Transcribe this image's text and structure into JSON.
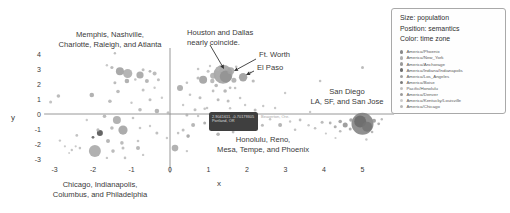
{
  "figure": {
    "background": "#ffffff"
  },
  "axes": {
    "x_label": "x",
    "y_label": "y",
    "x_ticks": [
      -3,
      -2,
      -1,
      0,
      1,
      2,
      3,
      4,
      5
    ],
    "y_ticks": [
      4,
      3,
      2,
      1,
      0,
      -1,
      -2,
      -3
    ],
    "axis_color": "#8c8c8c",
    "tick_color": "#3a3a3a"
  },
  "annotations": [
    {
      "name": "memphis-group",
      "lines": [
        "Memphis, Nashville,",
        "Charlotte, Raleigh, and Atlanta"
      ],
      "x": 110,
      "y": 30,
      "align": "center"
    },
    {
      "name": "houston-dallas",
      "lines": [
        "Houston and Dallas",
        "nearly coincide."
      ],
      "x": 187,
      "y": 28,
      "align": "left"
    },
    {
      "name": "ft-worth",
      "lines": [
        "Ft. Worth"
      ],
      "x": 259,
      "y": 50,
      "align": "left"
    },
    {
      "name": "el-paso",
      "lines": [
        "El Paso"
      ],
      "x": 257,
      "y": 63,
      "align": "left"
    },
    {
      "name": "san-diego-group",
      "lines": [
        "San Diego",
        "LA, SF, and San Jose"
      ],
      "x": 347,
      "y": 87,
      "align": "center"
    },
    {
      "name": "honolulu-group",
      "lines": [
        "Honolulu, Reno,",
        "Mesa, Tempe, and Phoenix"
      ],
      "x": 263,
      "y": 135,
      "align": "center"
    },
    {
      "name": "chicago-group",
      "lines": [
        "Chicago, Indianapolis,",
        "Columbus, and Philadelphia"
      ],
      "x": 100,
      "y": 180,
      "align": "center"
    }
  ],
  "arrows": [
    {
      "x1": 210,
      "y1": 45,
      "x2": 224,
      "y2": 69
    },
    {
      "x1": 256,
      "y1": 59,
      "x2": 234,
      "y2": 71
    },
    {
      "x1": 254,
      "y1": 71,
      "x2": 246,
      "y2": 75
    }
  ],
  "tooltip": {
    "line1": "2.9041611, -0.70179305",
    "line2": "Portland, OR",
    "side_text": "Beaverton, Ore.",
    "bg": "#3f3f3f"
  },
  "legend": {
    "title_lines": [
      "Size: population",
      "Position: semantics",
      "Color: time zone"
    ],
    "items": [
      {
        "label": "America/Phoenix",
        "color": "#8a8a8a"
      },
      {
        "label": "America/New_York",
        "color": "#b0b0b0"
      },
      {
        "label": "America/Anchorage",
        "color": "#9a9a9a"
      },
      {
        "label": "America/Indiana/Indianapolis",
        "color": "#6f6f6f"
      },
      {
        "label": "America/Los_Angeles",
        "color": "#a0a0a0"
      },
      {
        "label": "America/Boise",
        "color": "#7a7a7a"
      },
      {
        "label": "Pacific/Honolulu",
        "color": "#c0c0c0"
      },
      {
        "label": "America/Denver",
        "color": "#9a9a9a"
      },
      {
        "label": "America/Kentucky/Louisville",
        "color": "#cccccc"
      },
      {
        "label": "America/Chicago",
        "color": "#b8b8b8"
      }
    ]
  },
  "chart_data": {
    "type": "scatter",
    "title": "",
    "encoding": {
      "size": "population",
      "position": "semantics",
      "color": "time zone"
    },
    "xlabel": "x",
    "ylabel": "y",
    "xlim": [
      -3.5,
      5.9
    ],
    "ylim": [
      -3.9,
      4.4
    ],
    "grid": false,
    "legend_position": "top-right",
    "points_xyrc": [
      [
        -1.43,
        4.05,
        1.2,
        "#b5b5b5"
      ],
      [
        -1.51,
        3.1,
        1.6,
        "#b0b0b0"
      ],
      [
        -1.64,
        3.25,
        1.2,
        "#c0c0c0"
      ],
      [
        -1.3,
        2.85,
        4,
        "#9a9a9a"
      ],
      [
        -1.1,
        2.7,
        4.6,
        "#a8a8a8"
      ],
      [
        -0.78,
        2.6,
        3.6,
        "#a0a0a0"
      ],
      [
        -0.7,
        2.95,
        1.5,
        "#b5b5b5"
      ],
      [
        -0.52,
        2.85,
        1.4,
        "#ababab"
      ],
      [
        -0.4,
        2.7,
        2,
        "#b0b0b0"
      ],
      [
        -1.12,
        2.2,
        2.3,
        "#a5a5a5"
      ],
      [
        -0.9,
        2.3,
        1.3,
        "#bbbbbb"
      ],
      [
        -1.43,
        2.08,
        1.5,
        "#b0b0b0"
      ],
      [
        -0.6,
        2.2,
        2,
        "#aaaaaa"
      ],
      [
        -0.3,
        2.28,
        1.5,
        "#b5b5b5"
      ],
      [
        -1.35,
        1.5,
        1.8,
        "#b0b0b0"
      ],
      [
        -0.7,
        1.6,
        1.5,
        "#b8b8b8"
      ],
      [
        -0.4,
        1.75,
        1.2,
        "#c0c0c0"
      ],
      [
        -2.03,
        1.27,
        2.3,
        "#a5a5a5"
      ],
      [
        -1.56,
        0.85,
        1.8,
        "#b0b0b0"
      ],
      [
        -1.0,
        0.75,
        1.2,
        "#bdbdbd"
      ],
      [
        -0.52,
        0.95,
        1.5,
        "#b5b5b5"
      ],
      [
        -0.21,
        1.08,
        1.2,
        "#c2c2c2"
      ],
      [
        -3.1,
        0.8,
        1.5,
        "#b8b8b8"
      ],
      [
        -2.9,
        1.2,
        1.8,
        "#b0b0b0"
      ],
      [
        -0.78,
        0.28,
        1.8,
        "#b0b0b0"
      ],
      [
        -0.34,
        0.2,
        2.3,
        "#a8a8a8"
      ],
      [
        -0.05,
        0.08,
        1.5,
        "#b5b5b5"
      ],
      [
        -1.7,
        -0.15,
        1.8,
        "#b0b0b0"
      ],
      [
        -1.38,
        -0.4,
        4,
        "#a5a5a5"
      ],
      [
        -2.16,
        -0.4,
        1.2,
        "#c0c0c0"
      ],
      [
        -0.96,
        -0.27,
        1.3,
        "#bbbbbb"
      ],
      [
        -1.82,
        -1.27,
        3,
        "#4a4a4a"
      ],
      [
        -2.0,
        -1.55,
        1.4,
        "#5a5a5a"
      ],
      [
        -1.22,
        -1.07,
        4.6,
        "#9e9e9e"
      ],
      [
        -1.51,
        -0.93,
        1.8,
        "#b0b0b0"
      ],
      [
        -0.78,
        -0.93,
        1.3,
        "#bdbdbd"
      ],
      [
        -0.52,
        -0.8,
        1.2,
        "#c0c0c0"
      ],
      [
        -1.61,
        -1.8,
        2,
        "#aaaaaa"
      ],
      [
        -1.25,
        -1.93,
        1.8,
        "#b0b0b0"
      ],
      [
        -0.83,
        -1.8,
        1.3,
        "#bbbbbb"
      ],
      [
        -1.95,
        -2.47,
        6,
        "#a3a3a3"
      ],
      [
        -1.48,
        -2.47,
        1.8,
        "#b0b0b0"
      ],
      [
        -1.22,
        -2.27,
        1.5,
        "#b5b5b5"
      ],
      [
        -0.83,
        -2.27,
        2,
        "#ababab"
      ],
      [
        -0.7,
        -2.73,
        1.2,
        "#c0c0c0"
      ],
      [
        -2.34,
        -2.27,
        1.3,
        "#b8b8b8"
      ],
      [
        -2.45,
        -2.15,
        1.1,
        "#c0c0c0"
      ],
      [
        -2.55,
        -2.4,
        1.2,
        "#bbbbbb"
      ],
      [
        -2.73,
        -2.15,
        1.1,
        "#c2c2c2"
      ],
      [
        -2.62,
        -2.6,
        1.0,
        "#c5c5c5"
      ],
      [
        -1.64,
        -2.93,
        1.2,
        "#bdbdbd"
      ],
      [
        -1.17,
        -2.93,
        1.3,
        "#b8b8b8"
      ],
      [
        -2.86,
        -1.77,
        1.2,
        "#bdbdbd"
      ],
      [
        -2.42,
        -1.43,
        1.4,
        "#b8b8b8"
      ],
      [
        -1.87,
        -1.06,
        1.6,
        "#b0b0b0"
      ],
      [
        -0.34,
        -1.27,
        1.5,
        "#b5b5b5"
      ],
      [
        -0.08,
        -1.6,
        1.2,
        "#c0c0c0"
      ],
      [
        0.13,
        -2.27,
        3.3,
        "#a5a5a5"
      ],
      [
        0.44,
        -2.47,
        1.2,
        "#bdbdbd"
      ],
      [
        0.47,
        -1.47,
        1.8,
        "#9e9e9e"
      ],
      [
        0.21,
        -1.27,
        1.3,
        "#b8b8b8"
      ],
      [
        0.26,
        1.73,
        3,
        "#a3a3a3"
      ],
      [
        0.44,
        2.08,
        1.3,
        "#b8b8b8"
      ],
      [
        0.73,
        2.4,
        1.6,
        "#b0b0b0"
      ],
      [
        0.86,
        2.28,
        4,
        "#9a9a9a"
      ],
      [
        0.52,
        1.28,
        1.3,
        "#bbbbbb"
      ],
      [
        0.78,
        1.08,
        1.5,
        "#b3b3b3"
      ],
      [
        1.12,
        1.53,
        1.4,
        "#b5b5b5"
      ],
      [
        1.25,
        0.95,
        1.5,
        "#b0b0b0"
      ],
      [
        0.34,
        0.6,
        1.2,
        "#c0c0c0"
      ],
      [
        0.65,
        0.28,
        1.5,
        "#b5b5b5"
      ],
      [
        0.96,
        0.4,
        1.3,
        "#bbbbbb"
      ],
      [
        1.43,
        1.53,
        1.8,
        "#adadad"
      ],
      [
        1.69,
        1.73,
        1.3,
        "#b8b8b8"
      ],
      [
        1.51,
        0.87,
        1.5,
        "#b3b3b3"
      ],
      [
        1.82,
        1.07,
        1.3,
        "#bbbbbb"
      ],
      [
        1.95,
        0.6,
        1.2,
        "#c0c0c0"
      ],
      [
        2.21,
        0.27,
        1.5,
        "#b5b5b5"
      ],
      [
        2.42,
        0.53,
        1.2,
        "#bdbdbd"
      ],
      [
        3.9,
        2.2,
        1.3,
        "#b8b8b8"
      ],
      [
        5.0,
        3.1,
        1.5,
        "#b0b0b0"
      ],
      [
        2.99,
        1.4,
        1.2,
        "#c0c0c0"
      ],
      [
        3.64,
        0.14,
        1.2,
        "#c0c0c0"
      ],
      [
        1.38,
        2.65,
        9.5,
        "#9e9e9e"
      ],
      [
        1.45,
        2.5,
        6,
        "#919191"
      ],
      [
        1.58,
        2.88,
        3.5,
        "#a3a3a3"
      ],
      [
        1.25,
        3.0,
        2,
        "#b0b0b0"
      ],
      [
        1.12,
        2.55,
        3,
        "#a8a8a8"
      ],
      [
        1.1,
        2.2,
        2.2,
        "#b0b0b0"
      ],
      [
        1.66,
        2.25,
        2.5,
        "#a8a8a8"
      ],
      [
        1.9,
        2.45,
        4.2,
        "#969696"
      ],
      [
        0.99,
        2.85,
        1.5,
        "#b8b8b8"
      ],
      [
        1.04,
        3.2,
        1.2,
        "#bdbdbd"
      ],
      [
        0.73,
        3.0,
        1.3,
        "#bbbbbb"
      ],
      [
        1.72,
        3.15,
        1.3,
        "#b8b8b8"
      ],
      [
        2.08,
        2.75,
        1.4,
        "#b5b5b5"
      ],
      [
        2.16,
        2.2,
        1.6,
        "#b0b0b0"
      ],
      [
        1.2,
        1.9,
        1.8,
        "#aeaeae"
      ],
      [
        1.56,
        1.75,
        1.4,
        "#b5b5b5"
      ],
      [
        0.44,
        -0.07,
        1.5,
        "#b0b0b0"
      ],
      [
        0.73,
        -0.13,
        1.2,
        "#bdbdbd"
      ],
      [
        1.12,
        -0.27,
        2,
        "#a8a8a8"
      ],
      [
        0.9,
        -0.6,
        1.5,
        "#a3a3a3"
      ],
      [
        0.6,
        -0.73,
        2,
        "#aaaaaa"
      ],
      [
        0.34,
        -1.07,
        1.5,
        "#b5b5b5"
      ],
      [
        1.05,
        -0.95,
        1.4,
        "#b0b0b0"
      ],
      [
        1.3,
        -0.55,
        4.5,
        "#787878"
      ],
      [
        1.5,
        -0.65,
        3,
        "#8a8a8a"
      ],
      [
        1.66,
        -0.45,
        2.5,
        "#909090"
      ],
      [
        1.25,
        -1.35,
        1.8,
        "#a8a8a8"
      ],
      [
        1.64,
        -1.2,
        1.4,
        "#b3b3b3"
      ],
      [
        1.9,
        -1.0,
        1.3,
        "#b5b5b5"
      ],
      [
        2.1,
        -0.55,
        2,
        "#a5a5a5"
      ],
      [
        2.25,
        -0.4,
        1.6,
        "#ababab"
      ],
      [
        2.4,
        -0.75,
        1.5,
        "#b0b0b0"
      ],
      [
        2.6,
        -0.35,
        1.2,
        "#bdbdbd"
      ],
      [
        2.86,
        -0.73,
        2,
        "#a8a8a8"
      ],
      [
        3.12,
        -0.5,
        1.2,
        "#bdbdbd"
      ],
      [
        3.25,
        -1.05,
        1.3,
        "#b8b8b8"
      ],
      [
        3.38,
        -0.4,
        1.4,
        "#b3b3b3"
      ],
      [
        3.6,
        -0.75,
        1.2,
        "#bdbdbd"
      ],
      [
        3.77,
        -0.95,
        1.3,
        "#b8b8b8"
      ],
      [
        3.95,
        -0.55,
        1.5,
        "#b0b0b0"
      ],
      [
        0.9,
        0.35,
        1.3,
        "#b8b8b8"
      ],
      [
        1.56,
        0.38,
        1.2,
        "#bdbdbd"
      ],
      [
        2.73,
        0.4,
        1.2,
        "#c0c0c0"
      ],
      [
        4.16,
        -0.6,
        1.4,
        "#a8a8a8"
      ],
      [
        4.29,
        -0.85,
        1.5,
        "#a3a3a3"
      ],
      [
        4.42,
        -0.5,
        1.8,
        "#9a9a9a"
      ],
      [
        4.55,
        -0.73,
        2.5,
        "#8f8f8f"
      ],
      [
        4.68,
        -1.0,
        1.5,
        "#a3a3a3"
      ],
      [
        4.42,
        -1.15,
        1.3,
        "#b0b0b0"
      ],
      [
        4.7,
        -0.4,
        1.8,
        "#9a9a9a"
      ],
      [
        5.0,
        -0.65,
        11,
        "#7d7d7d"
      ],
      [
        4.94,
        -0.5,
        6,
        "#6a6a6a"
      ],
      [
        5.12,
        -0.85,
        5,
        "#747474"
      ],
      [
        5.3,
        -0.45,
        2,
        "#949494"
      ],
      [
        5.42,
        -0.65,
        1.4,
        "#a3a3a3"
      ],
      [
        5.5,
        -0.35,
        1.2,
        "#b0b0b0"
      ],
      [
        5.25,
        -1.2,
        1.3,
        "#ababab"
      ],
      [
        4.05,
        -1.3,
        1.1,
        "#c0c0c0"
      ],
      [
        5.1,
        -1.7,
        1.2,
        "#bdbdbd"
      ],
      [
        4.3,
        -1.6,
        1.1,
        "#c2c2c2"
      ]
    ]
  }
}
